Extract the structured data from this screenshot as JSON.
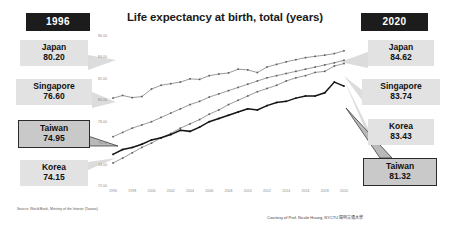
{
  "header": {
    "chart_title": "Life expectancy at birth, total (years)",
    "badge_left": "1996",
    "badge_right": "2020"
  },
  "labels_left": [
    {
      "country": "Japan",
      "value": "80.20",
      "highlight": false
    },
    {
      "country": "Singapore",
      "value": "76.60",
      "highlight": false
    },
    {
      "country": "Taiwan",
      "value": "74.95",
      "highlight": true
    },
    {
      "country": "Korea",
      "value": "74.15",
      "highlight": false
    }
  ],
  "labels_right": [
    {
      "country": "Japan",
      "value": "84.62",
      "highlight": false
    },
    {
      "country": "Singapore",
      "value": "83.74",
      "highlight": false
    },
    {
      "country": "Korea",
      "value": "83.43",
      "highlight": false
    },
    {
      "country": "Taiwan",
      "value": "81.32",
      "highlight": true
    }
  ],
  "footer": {
    "source": "Source: World Bank, Ministry of the Interior (Taiwan)",
    "credit": "Courtesy of Prof. Nicole Huang, NYCTU 陽明交通大學"
  },
  "chart_data": {
    "type": "line",
    "title": "Life expectancy at birth, total (years)",
    "xlabel": "",
    "ylabel": "",
    "xlim": [
      1996,
      2020
    ],
    "ylim": [
      72.0,
      86.0
    ],
    "grid": false,
    "legend": "none",
    "ytick_labels": [
      "86.00",
      "84.00",
      "82.00",
      "80.00",
      "78.00",
      "76.00",
      "74.00",
      "72.00"
    ],
    "ytick_values": [
      86,
      84,
      82,
      80,
      78,
      76,
      74,
      72
    ],
    "xtick_labels": [
      "1996",
      "1998",
      "2000",
      "2002",
      "2004",
      "2006",
      "2008",
      "2010",
      "2012",
      "2014",
      "2016",
      "2018",
      "2020"
    ],
    "x": [
      1996,
      1997,
      1998,
      1999,
      2000,
      2001,
      2002,
      2003,
      2004,
      2005,
      2006,
      2007,
      2008,
      2009,
      2010,
      2011,
      2012,
      2013,
      2014,
      2015,
      2016,
      2017,
      2018,
      2019,
      2020
    ],
    "series": [
      {
        "name": "Japan",
        "start_value": 80.2,
        "end_value": 84.62,
        "values": [
          80.2,
          80.45,
          80.25,
          80.35,
          81.05,
          81.4,
          81.55,
          81.7,
          82.0,
          81.95,
          82.3,
          82.45,
          82.55,
          82.9,
          82.84,
          82.59,
          83.1,
          83.35,
          83.59,
          83.79,
          83.98,
          84.1,
          84.21,
          84.36,
          84.62
        ]
      },
      {
        "name": "Singapore",
        "start_value": 76.6,
        "end_value": 83.74,
        "values": [
          76.6,
          77.0,
          77.4,
          77.7,
          78.0,
          78.4,
          78.8,
          79.2,
          79.6,
          79.9,
          80.3,
          80.6,
          80.9,
          81.2,
          81.5,
          81.8,
          82.1,
          82.3,
          82.5,
          82.7,
          82.9,
          83.1,
          83.3,
          83.5,
          83.74
        ]
      },
      {
        "name": "Korea",
        "start_value": 74.15,
        "end_value": 83.43,
        "values": [
          74.15,
          74.6,
          75.1,
          75.6,
          76.0,
          76.5,
          76.9,
          77.4,
          77.8,
          78.2,
          78.7,
          79.1,
          79.6,
          80.0,
          80.4,
          80.8,
          81.1,
          81.4,
          81.8,
          82.1,
          82.3,
          82.6,
          82.7,
          83.2,
          83.43
        ]
      },
      {
        "name": "Taiwan",
        "start_value": 74.95,
        "end_value": 81.32,
        "highlight": true,
        "values": [
          74.95,
          75.4,
          75.6,
          75.9,
          76.3,
          76.5,
          76.8,
          77.2,
          77.1,
          77.5,
          78.0,
          78.3,
          78.6,
          78.9,
          79.2,
          79.1,
          79.5,
          79.8,
          79.9,
          80.2,
          80.4,
          80.4,
          80.7,
          81.7,
          81.32
        ]
      }
    ]
  }
}
